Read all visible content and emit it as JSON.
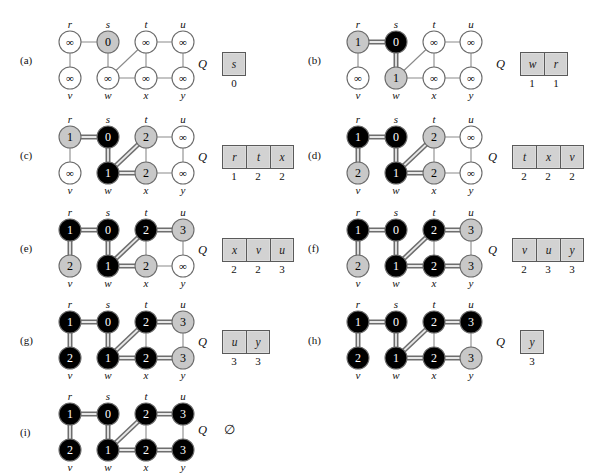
{
  "figure": {
    "caption_letters": [
      "(a)",
      "(b)",
      "(c)",
      "(d)",
      "(e)",
      "(f)",
      "(g)",
      "(h)",
      "(i)"
    ],
    "queue_letter": "Q",
    "empty_queue_symbol": "∅",
    "infinity_symbol": "∞",
    "colors": {
      "white_node_fill": "#ffffff",
      "gray_node_fill": "#c8c8c8",
      "black_node_fill": "#000000",
      "node_stroke": "#6b6b6b",
      "edge": "#8a8a8a",
      "tree_edge": "#6e6e6e",
      "tree_edge_highlight": "#e8e8e8",
      "queue_cell_fill": "#d2d2d2",
      "queue_cell_stroke": "#5a5a5a"
    }
  },
  "graph": {
    "vertex_labels": [
      "r",
      "s",
      "t",
      "u",
      "v",
      "w",
      "x",
      "y"
    ],
    "vertex_positions": {
      "r": [
        18,
        14
      ],
      "s": [
        56,
        14
      ],
      "t": [
        94,
        14
      ],
      "u": [
        131,
        14
      ],
      "v": [
        18,
        50
      ],
      "w": [
        56,
        50
      ],
      "x": [
        94,
        50
      ],
      "y": [
        131,
        50
      ]
    },
    "edges": [
      [
        "r",
        "s"
      ],
      [
        "r",
        "v"
      ],
      [
        "s",
        "w"
      ],
      [
        "w",
        "t"
      ],
      [
        "w",
        "x"
      ],
      [
        "t",
        "x"
      ],
      [
        "t",
        "u"
      ],
      [
        "x",
        "y"
      ],
      [
        "u",
        "y"
      ]
    ]
  },
  "panels": [
    {
      "id": "a",
      "label": "(a)",
      "origin": [
        52,
        28
      ],
      "queue_origin": [
        198,
        52
      ],
      "states": {
        "r": {
          "color": "white",
          "d": "∞"
        },
        "s": {
          "color": "gray",
          "d": "0"
        },
        "t": {
          "color": "white",
          "d": "∞"
        },
        "u": {
          "color": "white",
          "d": "∞"
        },
        "v": {
          "color": "white",
          "d": "∞"
        },
        "w": {
          "color": "white",
          "d": "∞"
        },
        "x": {
          "color": "white",
          "d": "∞"
        },
        "y": {
          "color": "white",
          "d": "∞"
        }
      },
      "tree_edges": [],
      "queue": {
        "items": [
          "s"
        ],
        "dists": [
          "0"
        ],
        "empty": false
      }
    },
    {
      "id": "b",
      "label": "(b)",
      "origin": [
        340,
        28
      ],
      "queue_origin": [
        496,
        52
      ],
      "states": {
        "r": {
          "color": "gray",
          "d": "1"
        },
        "s": {
          "color": "black",
          "d": "0"
        },
        "t": {
          "color": "white",
          "d": "∞"
        },
        "u": {
          "color": "white",
          "d": "∞"
        },
        "v": {
          "color": "white",
          "d": "∞"
        },
        "w": {
          "color": "gray",
          "d": "1"
        },
        "x": {
          "color": "white",
          "d": "∞"
        },
        "y": {
          "color": "white",
          "d": "∞"
        }
      },
      "tree_edges": [
        [
          "r",
          "s"
        ],
        [
          "s",
          "w"
        ]
      ],
      "queue": {
        "items": [
          "w",
          "r"
        ],
        "dists": [
          "1",
          "1"
        ],
        "empty": false
      }
    },
    {
      "id": "c",
      "label": "(c)",
      "origin": [
        52,
        123
      ],
      "queue_origin": [
        198,
        145
      ],
      "states": {
        "r": {
          "color": "gray",
          "d": "1"
        },
        "s": {
          "color": "black",
          "d": "0"
        },
        "t": {
          "color": "gray",
          "d": "2"
        },
        "u": {
          "color": "white",
          "d": "∞"
        },
        "v": {
          "color": "white",
          "d": "∞"
        },
        "w": {
          "color": "black",
          "d": "1"
        },
        "x": {
          "color": "gray",
          "d": "2"
        },
        "y": {
          "color": "white",
          "d": "∞"
        }
      },
      "tree_edges": [
        [
          "r",
          "s"
        ],
        [
          "s",
          "w"
        ],
        [
          "w",
          "t"
        ],
        [
          "w",
          "x"
        ]
      ],
      "queue": {
        "items": [
          "r",
          "t",
          "x"
        ],
        "dists": [
          "1",
          "2",
          "2"
        ],
        "empty": false
      }
    },
    {
      "id": "d",
      "label": "(d)",
      "origin": [
        340,
        123
      ],
      "queue_origin": [
        488,
        145
      ],
      "states": {
        "r": {
          "color": "black",
          "d": "1"
        },
        "s": {
          "color": "black",
          "d": "0"
        },
        "t": {
          "color": "gray",
          "d": "2"
        },
        "u": {
          "color": "white",
          "d": "∞"
        },
        "v": {
          "color": "gray",
          "d": "2"
        },
        "w": {
          "color": "black",
          "d": "1"
        },
        "x": {
          "color": "gray",
          "d": "2"
        },
        "y": {
          "color": "white",
          "d": "∞"
        }
      },
      "tree_edges": [
        [
          "r",
          "s"
        ],
        [
          "s",
          "w"
        ],
        [
          "w",
          "t"
        ],
        [
          "w",
          "x"
        ],
        [
          "r",
          "v"
        ]
      ],
      "queue": {
        "items": [
          "t",
          "x",
          "v"
        ],
        "dists": [
          "2",
          "2",
          "2"
        ],
        "empty": false
      }
    },
    {
      "id": "e",
      "label": "(e)",
      "origin": [
        52,
        216
      ],
      "queue_origin": [
        198,
        238
      ],
      "states": {
        "r": {
          "color": "black",
          "d": "1"
        },
        "s": {
          "color": "black",
          "d": "0"
        },
        "t": {
          "color": "black",
          "d": "2"
        },
        "u": {
          "color": "gray",
          "d": "3"
        },
        "v": {
          "color": "gray",
          "d": "2"
        },
        "w": {
          "color": "black",
          "d": "1"
        },
        "x": {
          "color": "gray",
          "d": "2"
        },
        "y": {
          "color": "white",
          "d": "∞"
        }
      },
      "tree_edges": [
        [
          "r",
          "s"
        ],
        [
          "s",
          "w"
        ],
        [
          "w",
          "t"
        ],
        [
          "w",
          "x"
        ],
        [
          "r",
          "v"
        ],
        [
          "t",
          "u"
        ]
      ],
      "queue": {
        "items": [
          "x",
          "v",
          "u"
        ],
        "dists": [
          "2",
          "2",
          "3"
        ],
        "empty": false
      }
    },
    {
      "id": "f",
      "label": "(f)",
      "origin": [
        340,
        216
      ],
      "queue_origin": [
        488,
        238
      ],
      "states": {
        "r": {
          "color": "black",
          "d": "1"
        },
        "s": {
          "color": "black",
          "d": "0"
        },
        "t": {
          "color": "black",
          "d": "2"
        },
        "u": {
          "color": "gray",
          "d": "3"
        },
        "v": {
          "color": "gray",
          "d": "2"
        },
        "w": {
          "color": "black",
          "d": "1"
        },
        "x": {
          "color": "black",
          "d": "2"
        },
        "y": {
          "color": "gray",
          "d": "3"
        }
      },
      "tree_edges": [
        [
          "r",
          "s"
        ],
        [
          "s",
          "w"
        ],
        [
          "w",
          "t"
        ],
        [
          "w",
          "x"
        ],
        [
          "r",
          "v"
        ],
        [
          "t",
          "u"
        ],
        [
          "x",
          "y"
        ]
      ],
      "queue": {
        "items": [
          "v",
          "u",
          "y"
        ],
        "dists": [
          "2",
          "3",
          "3"
        ],
        "empty": false
      }
    },
    {
      "id": "g",
      "label": "(g)",
      "origin": [
        52,
        308
      ],
      "queue_origin": [
        198,
        330
      ],
      "states": {
        "r": {
          "color": "black",
          "d": "1"
        },
        "s": {
          "color": "black",
          "d": "0"
        },
        "t": {
          "color": "black",
          "d": "2"
        },
        "u": {
          "color": "gray",
          "d": "3"
        },
        "v": {
          "color": "black",
          "d": "2"
        },
        "w": {
          "color": "black",
          "d": "1"
        },
        "x": {
          "color": "black",
          "d": "2"
        },
        "y": {
          "color": "gray",
          "d": "3"
        }
      },
      "tree_edges": [
        [
          "r",
          "s"
        ],
        [
          "s",
          "w"
        ],
        [
          "w",
          "t"
        ],
        [
          "w",
          "x"
        ],
        [
          "r",
          "v"
        ],
        [
          "t",
          "u"
        ],
        [
          "x",
          "y"
        ]
      ],
      "queue": {
        "items": [
          "u",
          "y"
        ],
        "dists": [
          "3",
          "3"
        ],
        "empty": false
      }
    },
    {
      "id": "h",
      "label": "(h)",
      "origin": [
        340,
        308
      ],
      "queue_origin": [
        496,
        330
      ],
      "states": {
        "r": {
          "color": "black",
          "d": "1"
        },
        "s": {
          "color": "black",
          "d": "0"
        },
        "t": {
          "color": "black",
          "d": "2"
        },
        "u": {
          "color": "black",
          "d": "3"
        },
        "v": {
          "color": "black",
          "d": "2"
        },
        "w": {
          "color": "black",
          "d": "1"
        },
        "x": {
          "color": "black",
          "d": "2"
        },
        "y": {
          "color": "gray",
          "d": "3"
        }
      },
      "tree_edges": [
        [
          "r",
          "s"
        ],
        [
          "s",
          "w"
        ],
        [
          "w",
          "t"
        ],
        [
          "w",
          "x"
        ],
        [
          "r",
          "v"
        ],
        [
          "t",
          "u"
        ],
        [
          "x",
          "y"
        ]
      ],
      "queue": {
        "items": [
          "y"
        ],
        "dists": [
          "3"
        ],
        "empty": false
      }
    },
    {
      "id": "i",
      "label": "(i)",
      "origin": [
        52,
        400
      ],
      "queue_origin": [
        198,
        418
      ],
      "states": {
        "r": {
          "color": "black",
          "d": "1"
        },
        "s": {
          "color": "black",
          "d": "0"
        },
        "t": {
          "color": "black",
          "d": "2"
        },
        "u": {
          "color": "black",
          "d": "3"
        },
        "v": {
          "color": "black",
          "d": "2"
        },
        "w": {
          "color": "black",
          "d": "1"
        },
        "x": {
          "color": "black",
          "d": "2"
        },
        "y": {
          "color": "black",
          "d": "3"
        }
      },
      "tree_edges": [
        [
          "r",
          "s"
        ],
        [
          "s",
          "w"
        ],
        [
          "w",
          "t"
        ],
        [
          "w",
          "x"
        ],
        [
          "r",
          "v"
        ],
        [
          "t",
          "u"
        ],
        [
          "x",
          "y"
        ]
      ],
      "queue": {
        "items": [],
        "dists": [],
        "empty": true
      }
    }
  ]
}
